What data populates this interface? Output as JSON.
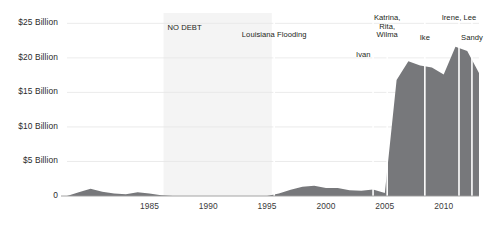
{
  "chart_data": {
    "type": "area",
    "title": "",
    "subtitle": "",
    "xlabel": "",
    "ylabel": "",
    "xlim": [
      1978,
      2013
    ],
    "ylim": [
      0,
      26.5
    ],
    "grid": true,
    "legend_position": "none",
    "axis_currency_unit": "Billion",
    "series": [
      {
        "name": "NFIP Debt",
        "color": "#77787b",
        "x": [
          1978,
          1979,
          1980,
          1981,
          1982,
          1983,
          1984,
          1985,
          1986,
          1987,
          1988,
          1989,
          1990,
          1991,
          1992,
          1993,
          1994,
          1995,
          1996,
          1997,
          1998,
          1999,
          2000,
          2001,
          2002,
          2003,
          2004,
          2005,
          2006,
          2007,
          2008,
          2009,
          2010,
          2011,
          2012,
          2013
        ],
        "values": [
          0.0,
          0.55,
          1.05,
          0.6,
          0.35,
          0.25,
          0.55,
          0.35,
          0.1,
          0.0,
          0.0,
          0.0,
          0.0,
          0.0,
          0.0,
          0.0,
          0.0,
          0.0,
          0.35,
          0.9,
          1.35,
          1.5,
          1.15,
          1.15,
          0.85,
          0.75,
          0.95,
          0.45,
          16.8,
          19.5,
          18.9,
          18.6,
          17.6,
          21.6,
          21.0,
          17.8
        ]
      }
    ],
    "y_ticks": [
      {
        "value": 25,
        "label": "$25 Billion"
      },
      {
        "value": 20,
        "label": "$20 Billion"
      },
      {
        "value": 15,
        "label": "$15 Billion"
      },
      {
        "value": 10,
        "label": "$10 Billion"
      },
      {
        "value": 5,
        "label": "$5 Billion"
      },
      {
        "value": 0,
        "label": "0"
      }
    ],
    "x_ticks": [
      {
        "value": 1985,
        "label": "1985"
      },
      {
        "value": 1990,
        "label": "1990"
      },
      {
        "value": 1995,
        "label": "1995"
      },
      {
        "value": 2000,
        "label": "2000"
      },
      {
        "value": 2005,
        "label": "2005"
      },
      {
        "value": 2010,
        "label": "2010"
      }
    ],
    "bands": [
      {
        "name": "no-debt-band",
        "label": "NO DEBT",
        "x_start": 1986.2,
        "x_end": 1995.4,
        "color": "#f4f4f4"
      }
    ],
    "annotations": [
      {
        "name": "louisiana-flooding",
        "label": "Louisiana Flooding",
        "x": 1995.6,
        "align": "center",
        "has_marker_line": true
      },
      {
        "name": "ivan",
        "label": "Ivan",
        "x": 2004.0,
        "align": "left",
        "has_marker_line": true
      },
      {
        "name": "katrina-rita-wilma",
        "label": "Katrina,\nRita,\nWilma",
        "x": 2005.2,
        "align": "center",
        "has_marker_line": true
      },
      {
        "name": "ike",
        "label": "Ike",
        "x": 2008.4,
        "align": "center",
        "has_marker_line": true
      },
      {
        "name": "irene-lee",
        "label": "Irene, Lee",
        "x": 2011.3,
        "align": "center",
        "has_marker_line": true
      },
      {
        "name": "sandy",
        "label": "Sandy",
        "x": 2012.4,
        "align": "center",
        "has_marker_line": true
      }
    ]
  },
  "colors": {
    "area_fill": "#77787b",
    "band_fill": "#f4f4f4",
    "gridline": "#e6e6e6",
    "axis_line": "#9a9a9a",
    "marker_line": "#ffffff",
    "text": "#231f20",
    "background": "#ffffff"
  }
}
